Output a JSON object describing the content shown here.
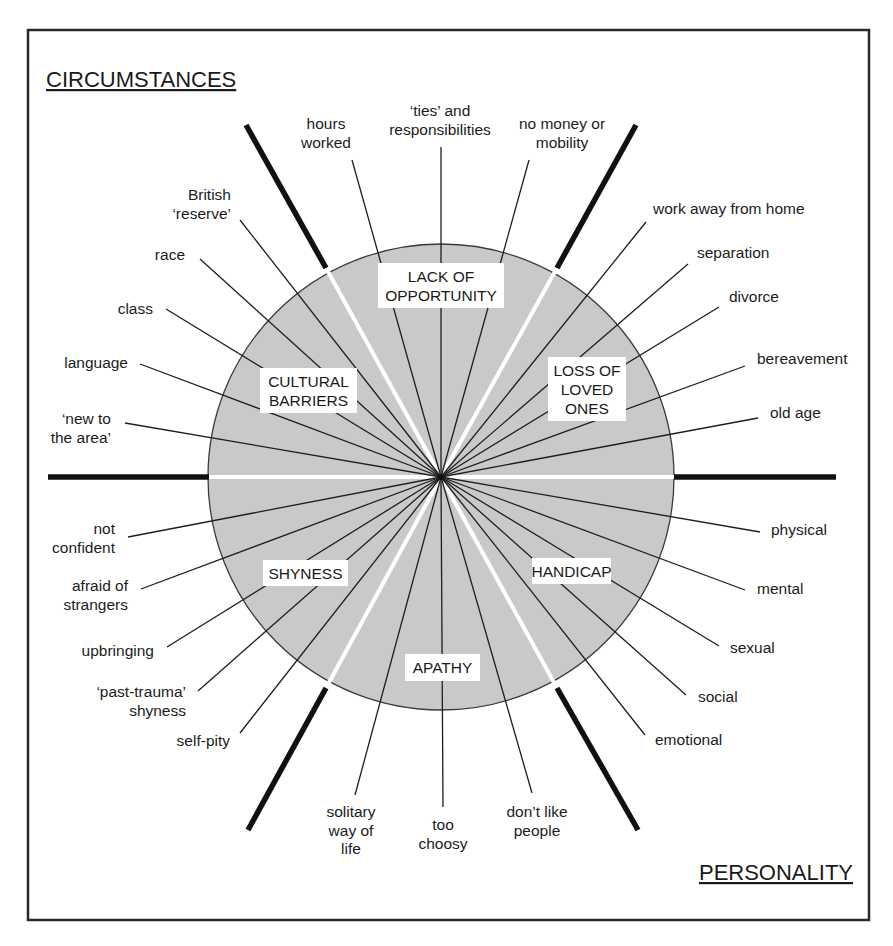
{
  "headings": {
    "top_left": "CIRCUMSTANCES",
    "bottom_right": "PERSONALITY"
  },
  "colors": {
    "disc_fill": "#c9c9c9",
    "line": "#1e1e1e",
    "divider_thick": "#111111",
    "divider_inner": "#ffffff",
    "frame": "#2a2a2a"
  },
  "center": {
    "x": 441,
    "y": 477,
    "r": 233
  },
  "sections": [
    {
      "id": "lack-of-opportunity",
      "lines": [
        "LACK OF",
        "OPPORTUNITY"
      ],
      "box": [
        378,
        263,
        126,
        45
      ]
    },
    {
      "id": "loss-of-loved-ones",
      "lines": [
        "LOSS OF",
        "LOVED",
        "ONES"
      ],
      "box": [
        548,
        357,
        78,
        64
      ]
    },
    {
      "id": "handicap",
      "lines": [
        "HANDICAP"
      ],
      "box": [
        532,
        558,
        79,
        26
      ]
    },
    {
      "id": "apathy",
      "lines": [
        "APATHY"
      ],
      "box": [
        405,
        654,
        75,
        27
      ]
    },
    {
      "id": "shyness",
      "lines": [
        "SHYNESS"
      ],
      "box": [
        263,
        560,
        85,
        26
      ]
    },
    {
      "id": "cultural-barriers",
      "lines": [
        "CULTURAL",
        "BARRIERS"
      ],
      "box": [
        260,
        368,
        97,
        45
      ]
    }
  ],
  "factors": [
    {
      "section": "lack-of-opportunity",
      "lines": [
        "hours",
        "worked"
      ],
      "end": [
        352,
        160
      ],
      "text_x": 326,
      "text_y": 129,
      "anchor": "middle"
    },
    {
      "section": "lack-of-opportunity",
      "lines": [
        "‘ties’ and",
        "responsibilities"
      ],
      "end": [
        441,
        147
      ],
      "text_x": 440,
      "text_y": 116,
      "anchor": "middle"
    },
    {
      "section": "lack-of-opportunity",
      "lines": [
        "no money or",
        "mobility"
      ],
      "end": [
        529,
        160
      ],
      "text_x": 562,
      "text_y": 129,
      "anchor": "middle"
    },
    {
      "section": "loss-of-loved-ones",
      "lines": [
        "work away from home"
      ],
      "end": [
        646,
        222
      ],
      "text_x": 653,
      "text_y": 214,
      "anchor": "start"
    },
    {
      "section": "loss-of-loved-ones",
      "lines": [
        "separation"
      ],
      "end": [
        688,
        264
      ],
      "text_x": 697,
      "text_y": 258,
      "anchor": "start"
    },
    {
      "section": "loss-of-loved-ones",
      "lines": [
        "divorce"
      ],
      "end": [
        719,
        307
      ],
      "text_x": 729,
      "text_y": 302,
      "anchor": "start"
    },
    {
      "section": "loss-of-loved-ones",
      "lines": [
        "bereavement"
      ],
      "end": [
        745,
        366
      ],
      "text_x": 757,
      "text_y": 364,
      "anchor": "start"
    },
    {
      "section": "loss-of-loved-ones",
      "lines": [
        "old age"
      ],
      "end": [
        758,
        418
      ],
      "text_x": 770,
      "text_y": 418,
      "anchor": "start"
    },
    {
      "section": "handicap",
      "lines": [
        "physical"
      ],
      "end": [
        760,
        532
      ],
      "text_x": 771,
      "text_y": 535,
      "anchor": "start"
    },
    {
      "section": "handicap",
      "lines": [
        "mental"
      ],
      "end": [
        745,
        590
      ],
      "text_x": 757,
      "text_y": 594,
      "anchor": "start"
    },
    {
      "section": "handicap",
      "lines": [
        "sexual"
      ],
      "end": [
        719,
        646
      ],
      "text_x": 730,
      "text_y": 653,
      "anchor": "start"
    },
    {
      "section": "handicap",
      "lines": [
        "social"
      ],
      "end": [
        686,
        695
      ],
      "text_x": 698,
      "text_y": 702,
      "anchor": "start"
    },
    {
      "section": "handicap",
      "lines": [
        "emotional"
      ],
      "end": [
        645,
        735
      ],
      "text_x": 655,
      "text_y": 745,
      "anchor": "start"
    },
    {
      "section": "apathy",
      "lines": [
        "solitary",
        "way of",
        "life"
      ],
      "end": [
        355,
        795
      ],
      "text_x": 351,
      "text_y": 817,
      "anchor": "middle"
    },
    {
      "section": "apathy",
      "lines": [
        "too",
        "choosy"
      ],
      "end": [
        443,
        807
      ],
      "text_x": 443,
      "text_y": 830,
      "anchor": "middle"
    },
    {
      "section": "apathy",
      "lines": [
        "don’t like",
        "people"
      ],
      "end": [
        532,
        793
      ],
      "text_x": 537,
      "text_y": 817,
      "anchor": "middle"
    },
    {
      "section": "shyness",
      "lines": [
        "not",
        "confident"
      ],
      "end": [
        128,
        537
      ],
      "text_x": 115,
      "text_y": 534,
      "anchor": "end"
    },
    {
      "section": "shyness",
      "lines": [
        "afraid of",
        "strangers"
      ],
      "end": [
        141,
        589
      ],
      "text_x": 128,
      "text_y": 591,
      "anchor": "end"
    },
    {
      "section": "shyness",
      "lines": [
        "upbringing"
      ],
      "end": [
        167,
        647
      ],
      "text_x": 154,
      "text_y": 656,
      "anchor": "end"
    },
    {
      "section": "shyness",
      "lines": [
        "‘past-trauma’",
        "shyness"
      ],
      "end": [
        198,
        691
      ],
      "text_x": 186,
      "text_y": 697,
      "anchor": "end"
    },
    {
      "section": "shyness",
      "lines": [
        "self-pity"
      ],
      "end": [
        240,
        733
      ],
      "text_x": 230,
      "text_y": 746,
      "anchor": "end"
    },
    {
      "section": "cultural-barriers",
      "lines": [
        "British",
        "‘reserve’"
      ],
      "end": [
        240,
        220
      ],
      "text_x": 231,
      "text_y": 200,
      "anchor": "end"
    },
    {
      "section": "cultural-barriers",
      "lines": [
        "race"
      ],
      "end": [
        200,
        259
      ],
      "text_x": 185,
      "text_y": 260,
      "anchor": "end"
    },
    {
      "section": "cultural-barriers",
      "lines": [
        "class"
      ],
      "end": [
        166,
        309
      ],
      "text_x": 153,
      "text_y": 314,
      "anchor": "end"
    },
    {
      "section": "cultural-barriers",
      "lines": [
        "language"
      ],
      "end": [
        140,
        364
      ],
      "text_x": 128,
      "text_y": 368,
      "anchor": "end"
    },
    {
      "section": "cultural-barriers",
      "lines": [
        "‘new to",
        "the area’"
      ],
      "end": [
        125,
        423
      ],
      "text_x": 111,
      "text_y": 424,
      "anchor": "end"
    }
  ],
  "dividers": [
    {
      "outer": [
        48,
        477
      ],
      "rim": [
        209,
        477
      ]
    },
    {
      "outer": [
        836,
        477
      ],
      "rim": [
        674,
        477
      ]
    },
    {
      "outer": [
        246,
        125
      ],
      "rim": [
        326,
        268
      ]
    },
    {
      "outer": [
        636,
        125
      ],
      "rim": [
        557,
        268
      ]
    },
    {
      "outer": [
        248,
        830
      ],
      "rim": [
        326,
        688
      ]
    },
    {
      "outer": [
        638,
        830
      ],
      "rim": [
        557,
        688
      ]
    }
  ]
}
